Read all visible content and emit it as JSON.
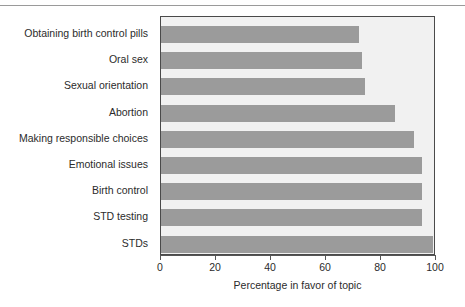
{
  "chart_data": {
    "type": "bar",
    "orientation": "horizontal",
    "title": "",
    "subtitle": "",
    "xlabel": "Percentage in favor of topic",
    "ylabel": "",
    "categories": [
      "Obtaining birth control pills",
      "Oral sex",
      "Sexual orientation",
      "Abortion",
      "Making responsible choices",
      "Emotional issues",
      "Birth control",
      "STD testing",
      "STDs"
    ],
    "values": [
      72,
      73,
      74,
      85,
      92,
      95,
      95,
      95,
      99
    ],
    "xlim": [
      0,
      100
    ],
    "xticks": [
      0,
      20,
      40,
      60,
      80,
      100
    ],
    "xtick_labels": [
      "0",
      "20",
      "40",
      "60",
      "80",
      "100"
    ],
    "grid": false,
    "legend": false,
    "bar_color": "#9b9b9b",
    "plot_background": "#f1f1f1",
    "frame_color": "#4a4a4a"
  },
  "axis": {
    "x_title": "Percentage in favor of topic"
  }
}
